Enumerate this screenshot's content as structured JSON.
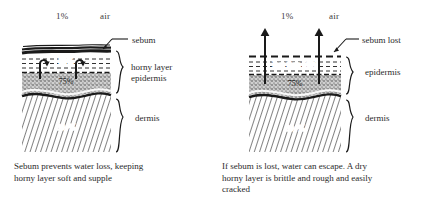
{
  "figure": {
    "type": "diagram",
    "background": "#ffffff",
    "ink": "#1a1a1a"
  },
  "panels": [
    {
      "id": "with-sebum",
      "air_percent": "1%",
      "air_label": "air",
      "surface_callout": "sebum",
      "surface_state": "intact",
      "layers": [
        {
          "name": "sebum",
          "value": "",
          "fill": "solid-black"
        },
        {
          "name": "horny layer",
          "value": "50%",
          "fill": "lined-white"
        },
        {
          "name": "epidermis",
          "value": "75%",
          "fill": "stipple-grey"
        },
        {
          "name": "dermis",
          "value": "80+%",
          "fill": "hatched"
        }
      ],
      "braces": [
        {
          "labels": [
            "horny layer",
            "epidermis"
          ]
        },
        {
          "labels": [
            "dermis"
          ]
        }
      ],
      "arrows": {
        "direction": "up-blocked",
        "count": 2
      },
      "caption": "Sebum prevents water loss, keeping\nhorny layer soft and supple"
    },
    {
      "id": "sebum-lost",
      "air_percent": "1%",
      "air_label": "air",
      "surface_callout": "sebum lost",
      "surface_state": "dashed-broken",
      "layers": [
        {
          "name": "horny layer",
          "value": "less than 50%",
          "fill": "lined-white"
        },
        {
          "name": "epidermis",
          "value": "75%",
          "fill": "stipple-grey"
        },
        {
          "name": "dermis",
          "value": "80+%",
          "fill": "hatched"
        }
      ],
      "braces": [
        {
          "labels": [
            "epidermis"
          ]
        },
        {
          "labels": [
            "dermis"
          ]
        }
      ],
      "arrows": {
        "direction": "up-escaping",
        "count": 2
      },
      "caption": "If sebum is lost, water can escape. A dry\nhorny layer is brittle and rough and easily\ncracked"
    }
  ]
}
